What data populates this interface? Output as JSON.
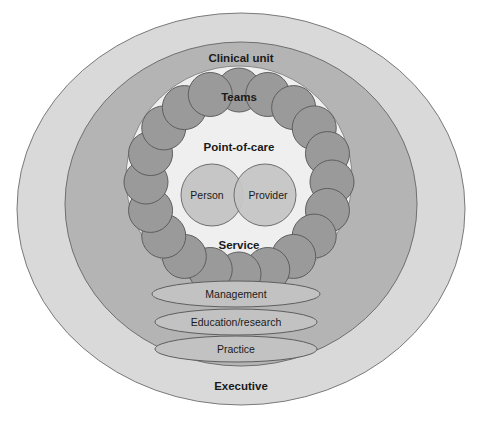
{
  "diagram": {
    "title_visible": false,
    "background_color": "#ffffff",
    "rings": [
      {
        "id": "executive",
        "label": "Executive",
        "label_weight": "bold",
        "fill": "#d9d9d9",
        "stroke": "#7a7a7a",
        "cx": 241,
        "cy": 209,
        "rx": 224,
        "ry": 196,
        "label_x": 241,
        "label_y": 390
      },
      {
        "id": "clinical-unit",
        "label": "Clinical unit",
        "label_weight": "bold",
        "fill": "#b4b4b4",
        "stroke": "#6f6f6f",
        "cx": 241,
        "cy": 204,
        "rx": 176,
        "ry": 162,
        "label_x": 241,
        "label_y": 62
      },
      {
        "id": "service",
        "label": "Service",
        "label_weight": "bold",
        "fill": "#efefef",
        "stroke": "#8a8a8a",
        "cx": 239,
        "cy": 178,
        "rx": 113,
        "ry": 112,
        "label_x": 239,
        "label_y": 249
      }
    ],
    "ring_of_circles": {
      "id": "teams-ring",
      "label": "Teams",
      "label_weight": "bold",
      "label_x": 239,
      "label_y": 101,
      "fill": "#9a9a9a",
      "stroke": "#5e5e5e",
      "count": 20,
      "ring_cx": 239,
      "ring_cy": 182,
      "ring_rx": 93,
      "ring_ry": 92,
      "circle_r": 22
    },
    "inner_zone": {
      "id": "point-of-care",
      "label": "Point-of-care",
      "label_weight": "bold",
      "label_x": 239,
      "label_y": 151
    },
    "core_circles": [
      {
        "id": "person",
        "label": "Person",
        "label_weight": "normal",
        "fill": "#c6c6c6",
        "stroke": "#6f6f6f",
        "cx": 212,
        "cy": 195,
        "r": 31,
        "label_x": 207,
        "label_y": 199
      },
      {
        "id": "provider",
        "label": "Provider",
        "label_weight": "normal",
        "fill": "#c6c6c6",
        "stroke": "#6f6f6f",
        "cx": 265,
        "cy": 195,
        "r": 31,
        "label_x": 268,
        "label_y": 199
      }
    ],
    "lozenges": [
      {
        "id": "management",
        "label": "Management",
        "label_weight": "normal",
        "fill": "#c2c2c2",
        "stroke": "#5e5e5e",
        "cx": 236,
        "cy": 294,
        "rx": 84,
        "ry": 13,
        "label_x": 236,
        "label_y": 298
      },
      {
        "id": "education-research",
        "label": "Education/research",
        "label_weight": "normal",
        "fill": "#c2c2c2",
        "stroke": "#5e5e5e",
        "cx": 236,
        "cy": 322,
        "rx": 81,
        "ry": 13,
        "label_x": 236,
        "label_y": 326
      },
      {
        "id": "practice",
        "label": "Practice",
        "label_weight": "normal",
        "fill": "#c2c2c2",
        "stroke": "#5e5e5e",
        "cx": 236,
        "cy": 349,
        "rx": 81,
        "ry": 13,
        "label_x": 236,
        "label_y": 353
      }
    ]
  }
}
